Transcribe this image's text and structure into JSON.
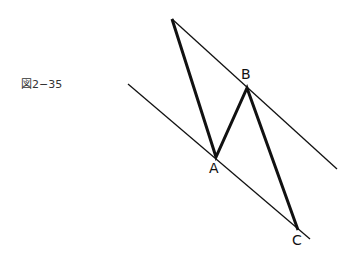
{
  "figure": {
    "caption": "図2−35",
    "points": {
      "start": {
        "x": 172,
        "y": 19
      },
      "A": {
        "label": "A",
        "x": 216,
        "y": 157
      },
      "B": {
        "label": "B",
        "x": 247,
        "y": 88
      },
      "C": {
        "label": "C",
        "x": 298,
        "y": 230
      }
    },
    "upper_line": {
      "x1": 172,
      "y1": 19,
      "x2": 337,
      "y2": 169
    },
    "lower_line": {
      "x1": 128,
      "y1": 84,
      "x2": 310,
      "y2": 239
    }
  }
}
